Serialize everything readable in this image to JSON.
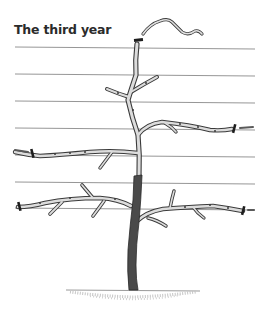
{
  "diagram": {
    "title": "The third year",
    "colors": {
      "background": "#ffffff",
      "wire": "#8a8a8a",
      "branch_outline": "#3a3a3a",
      "branch_fill": "#d9d9d9",
      "trunk_fill": "#4a4a4a",
      "cut_mark": "#1e1e1e",
      "ground": "#9a9a9a",
      "title": "#2b2b2b"
    },
    "wires": [
      {
        "y_left": 47,
        "y_right": 49
      },
      {
        "y_left": 74,
        "y_right": 76
      },
      {
        "y_left": 101,
        "y_right": 103
      },
      {
        "y_left": 128,
        "y_right": 130
      },
      {
        "y_left": 155,
        "y_right": 157
      },
      {
        "y_left": 182,
        "y_right": 184
      },
      {
        "y_left": 208,
        "y_right": 210
      }
    ],
    "elements": [
      "pruned-leader-shoot",
      "leader-cut-mark",
      "upper-side-shoots",
      "tier-2-left-arm",
      "tier-2-right-arm",
      "tier-1-left-arm",
      "tier-1-right-arm",
      "arm-tip-cut-marks",
      "trunk",
      "ground"
    ]
  }
}
